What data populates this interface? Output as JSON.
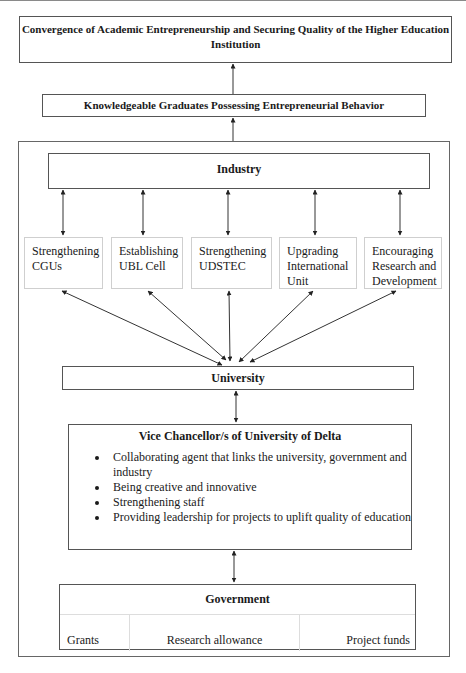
{
  "diagram": {
    "top_box": {
      "label": "Convergence of Academic Entrepreneurship and Securing Quality of the Higher Education Institution"
    },
    "outcome_box": {
      "label": "Knowledgeable Graduates Possessing Entrepreneurial Behavior"
    },
    "industry": {
      "label": "Industry"
    },
    "initiatives": [
      {
        "label": "Strengthening CGUs"
      },
      {
        "label": "Establishing UBL Cell"
      },
      {
        "label": "Strengthening UDSTEC"
      },
      {
        "label": "Upgrading International Unit"
      },
      {
        "label": "Encouraging Research and Development"
      }
    ],
    "university": {
      "label": "University"
    },
    "vice_chancellor": {
      "title": "Vice Chancellor/s of University of Delta",
      "roles": [
        "Collaborating agent that links the university, government and industry",
        "Being creative and innovative",
        "Strengthening staff",
        "Providing leadership for projects to uplift quality of education"
      ]
    },
    "government": {
      "label": "Government",
      "funding": [
        "Grants",
        "Research allowance",
        "Project funds"
      ]
    },
    "connections": [
      {
        "from": "outcome_box",
        "to": "top_box",
        "type": "arrow"
      },
      {
        "from": "outer_frame",
        "to": "outcome_box",
        "type": "arrow"
      },
      {
        "from": "industry",
        "to": "initiatives.0",
        "type": "bidirectional"
      },
      {
        "from": "industry",
        "to": "initiatives.1",
        "type": "bidirectional"
      },
      {
        "from": "industry",
        "to": "initiatives.2",
        "type": "bidirectional"
      },
      {
        "from": "industry",
        "to": "initiatives.3",
        "type": "bidirectional"
      },
      {
        "from": "industry",
        "to": "initiatives.4",
        "type": "bidirectional"
      },
      {
        "from": "university",
        "to": "initiatives.0",
        "type": "bidirectional"
      },
      {
        "from": "university",
        "to": "initiatives.1",
        "type": "bidirectional"
      },
      {
        "from": "university",
        "to": "initiatives.2",
        "type": "bidirectional"
      },
      {
        "from": "university",
        "to": "initiatives.3",
        "type": "bidirectional"
      },
      {
        "from": "university",
        "to": "initiatives.4",
        "type": "bidirectional"
      },
      {
        "from": "university",
        "to": "vice_chancellor",
        "type": "bidirectional"
      },
      {
        "from": "vice_chancellor",
        "to": "government",
        "type": "bidirectional"
      }
    ]
  }
}
